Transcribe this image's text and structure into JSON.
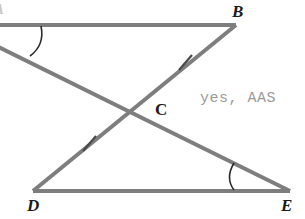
{
  "figure": {
    "background_color": "#ffffff",
    "line_color": "#7e7e7e",
    "mark_color": "#4a4a4a",
    "width": 305,
    "height": 219
  },
  "labels": {
    "a_partial": "A",
    "b": "B",
    "c": "C",
    "d": "D",
    "e": "E"
  },
  "annotation": {
    "answer": "yes, AAS",
    "color": "#9b9b9b"
  },
  "geometry": {
    "points": {
      "A": {
        "x": -40,
        "y": 25
      },
      "B": {
        "x": 236,
        "y": 25
      },
      "C": {
        "x": 135,
        "y": 110
      },
      "D": {
        "x": 33,
        "y": 191
      },
      "E": {
        "x": 290,
        "y": 191
      }
    },
    "segments": [
      {
        "name": "AB",
        "from": "A",
        "to": "B"
      },
      {
        "name": "DE",
        "from": "D",
        "to": "E"
      },
      {
        "name": "BD",
        "from": "B",
        "to": "D"
      },
      {
        "name": "AE",
        "from": "A",
        "to": "E"
      }
    ],
    "tick_marks": [
      {
        "name": "tick-BC",
        "x": 185,
        "y": 62
      },
      {
        "name": "tick-CD",
        "x": 89,
        "y": 143
      }
    ],
    "angle_arcs": [
      {
        "name": "angle-A",
        "vertex": "A"
      },
      {
        "name": "angle-E",
        "vertex": "E"
      }
    ]
  }
}
